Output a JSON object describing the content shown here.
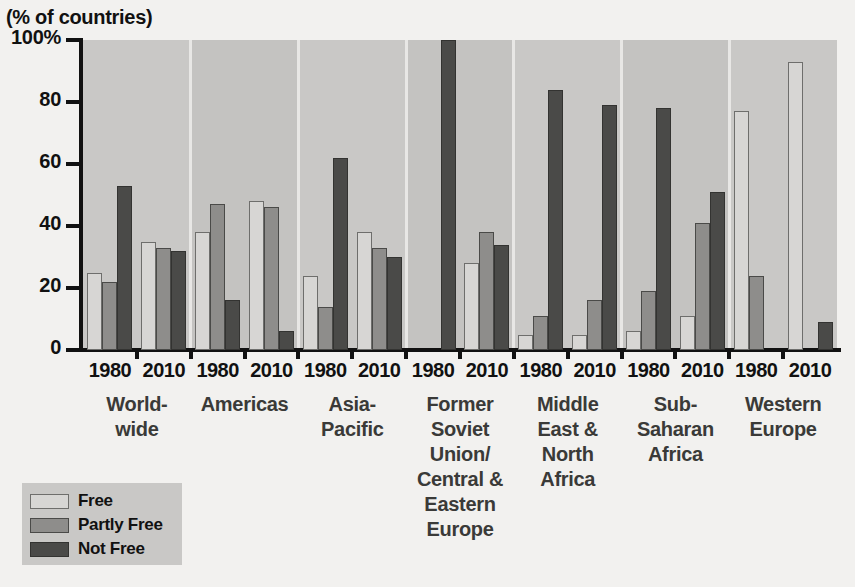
{
  "chart_data": {
    "type": "bar",
    "title": "",
    "subtitle": "",
    "ylabel": "(% of countries)",
    "xlabel": "",
    "ylim": [
      0,
      100
    ],
    "yticks": [
      0,
      20,
      40,
      60,
      80,
      100
    ],
    "ytick_labels": [
      "0",
      "20",
      "40",
      "60",
      "80",
      "100%"
    ],
    "grid": false,
    "legend_position": "below-left",
    "legend": [
      "Free",
      "Partly Free",
      "Not Free"
    ],
    "series": [
      {
        "name": "Free",
        "color": "#d7d6d4",
        "values": [
          25,
          35,
          38,
          48,
          24,
          38,
          0,
          28,
          5,
          5,
          6,
          11,
          77,
          93
        ]
      },
      {
        "name": "Partly Free",
        "color": "#8e8d8b",
        "values": [
          22,
          33,
          47,
          46,
          14,
          33,
          0,
          38,
          11,
          16,
          19,
          41,
          24,
          0
        ]
      },
      {
        "name": "Not Free",
        "color": "#4a4a48",
        "values": [
          53,
          32,
          16,
          6,
          62,
          30,
          100,
          34,
          84,
          79,
          78,
          51,
          0,
          9
        ]
      }
    ],
    "categories": [
      "Worldwide 1980",
      "Worldwide 2010",
      "Americas 1980",
      "Americas 2010",
      "Asia-Pacific 1980",
      "Asia-Pacific 2010",
      "Former Soviet Union/Central & Eastern Europe 1980",
      "Former Soviet Union/Central & Eastern Europe 2010",
      "Middle East & North Africa 1980",
      "Middle East & North Africa 2010",
      "Sub-Saharan Africa 1980",
      "Sub-Saharan Africa 2010",
      "Western Europe 1980",
      "Western Europe 2010"
    ],
    "regions": [
      {
        "label": "World-\nwide",
        "lines": [
          "World-",
          "wide"
        ],
        "years": [
          {
            "year": "1980",
            "free": 25,
            "partly_free": 22,
            "not_free": 53
          },
          {
            "year": "2010",
            "free": 35,
            "partly_free": 33,
            "not_free": 32
          }
        ]
      },
      {
        "label": "Americas",
        "lines": [
          "Americas"
        ],
        "years": [
          {
            "year": "1980",
            "free": 38,
            "partly_free": 47,
            "not_free": 16
          },
          {
            "year": "2010",
            "free": 48,
            "partly_free": 46,
            "not_free": 6
          }
        ]
      },
      {
        "label": "Asia-\nPacific",
        "lines": [
          "Asia-",
          "Pacific"
        ],
        "years": [
          {
            "year": "1980",
            "free": 24,
            "partly_free": 14,
            "not_free": 62
          },
          {
            "year": "2010",
            "free": 38,
            "partly_free": 33,
            "not_free": 30
          }
        ]
      },
      {
        "label": "Former Soviet Union/ Central & Eastern Europe",
        "lines": [
          "Former",
          "Soviet",
          "Union/",
          "Central &",
          "Eastern",
          "Europe"
        ],
        "years": [
          {
            "year": "1980",
            "free": 0,
            "partly_free": 0,
            "not_free": 100
          },
          {
            "year": "2010",
            "free": 28,
            "partly_free": 38,
            "not_free": 34
          }
        ]
      },
      {
        "label": "Middle East & North Africa",
        "lines": [
          "Middle",
          "East &",
          "North",
          "Africa"
        ],
        "years": [
          {
            "year": "1980",
            "free": 5,
            "partly_free": 11,
            "not_free": 84
          },
          {
            "year": "2010",
            "free": 5,
            "partly_free": 16,
            "not_free": 79
          }
        ]
      },
      {
        "label": "Sub-Saharan Africa",
        "lines": [
          "Sub-",
          "Saharan",
          "Africa"
        ],
        "years": [
          {
            "year": "1980",
            "free": 6,
            "partly_free": 19,
            "not_free": 78
          },
          {
            "year": "2010",
            "free": 11,
            "partly_free": 41,
            "not_free": 51
          }
        ]
      },
      {
        "label": "Western Europe",
        "lines": [
          "Western",
          "Europe"
        ],
        "years": [
          {
            "year": "1980",
            "free": 77,
            "partly_free": 24,
            "not_free": 0
          },
          {
            "year": "2010",
            "free": 93,
            "partly_free": 0,
            "not_free": 9
          }
        ]
      }
    ]
  },
  "colors": {
    "free": "#d7d6d4",
    "partly_free": "#8e8d8b",
    "not_free": "#4a4a48",
    "plot_background": "#c9c8c6",
    "page_background": "#f2f1ef",
    "axis": "#111111"
  }
}
